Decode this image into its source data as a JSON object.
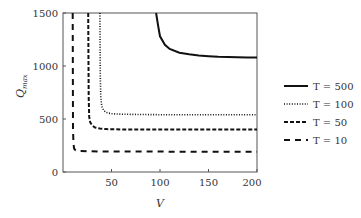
{
  "chart_data": {
    "type": "line",
    "title": "",
    "xlabel": "V",
    "ylabel": "Q_max",
    "xlim": [
      0,
      200
    ],
    "ylim": [
      0,
      1500
    ],
    "xticks": [
      50,
      100,
      150,
      200
    ],
    "yticks": [
      0,
      500,
      1000,
      1500
    ],
    "grid": false,
    "legend_position": "right",
    "series": [
      {
        "name": "T = 500",
        "style": "solid",
        "x": [
          96,
          98,
          100,
          105,
          110,
          120,
          130,
          140,
          150,
          160,
          170,
          180,
          190,
          200
        ],
        "y": [
          1500,
          1380,
          1280,
          1200,
          1160,
          1125,
          1110,
          1100,
          1092,
          1087,
          1084,
          1082,
          1080,
          1080
        ]
      },
      {
        "name": "T = 100",
        "style": "dotted",
        "x": [
          38,
          38.5,
          39,
          40,
          42,
          45,
          50,
          60,
          80,
          100,
          150,
          200
        ],
        "y": [
          1500,
          900,
          700,
          620,
          580,
          560,
          550,
          545,
          542,
          541,
          540,
          540
        ]
      },
      {
        "name": "T = 50",
        "style": "dashed",
        "x": [
          26,
          26.5,
          27,
          28,
          30,
          33,
          38,
          45,
          60,
          100,
          150,
          200
        ],
        "y": [
          1500,
          700,
          520,
          470,
          440,
          420,
          410,
          405,
          402,
          401,
          400,
          400
        ]
      },
      {
        "name": "T = 10",
        "style": "loosely-dashed",
        "x": [
          10,
          10.3,
          10.8,
          11.5,
          13,
          16,
          25,
          50,
          100,
          150,
          200
        ],
        "y": [
          1500,
          400,
          260,
          220,
          205,
          198,
          195,
          193,
          192,
          191,
          191
        ]
      }
    ]
  },
  "axes": {
    "xlabel": "V",
    "ylabel_main": "Q",
    "ylabel_sub": "max",
    "xtick_labels": [
      "50",
      "100",
      "150",
      "200"
    ],
    "ytick_labels": [
      "0",
      "500",
      "1000",
      "1500"
    ]
  },
  "legend": {
    "items": [
      {
        "label": "T = 500"
      },
      {
        "label": "T = 100"
      },
      {
        "label": "T = 50"
      },
      {
        "label": "T = 10"
      }
    ]
  }
}
